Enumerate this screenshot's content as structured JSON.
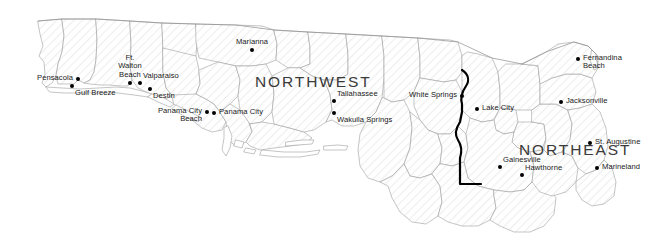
{
  "map": {
    "title": "North Florida Regions",
    "background_color": "#ffffff",
    "county_outline_color": "#9a9a9a",
    "region_boundary_color": "#000000",
    "marker_color": "#000000",
    "label_color": "#1a1a1a",
    "region_label_color": "#3a3a3a",
    "county_fill": "#fefefe",
    "hatch_color": "#f0f0f0"
  },
  "regions": [
    {
      "name": "NORTHWEST",
      "x": 255,
      "y": 73
    },
    {
      "name": "NORTHEAST",
      "x": 519,
      "y": 141
    }
  ],
  "cities": [
    {
      "name": "Pensacola",
      "x": 78,
      "y": 79,
      "anchor": "left",
      "lines": [
        "Pensacola"
      ]
    },
    {
      "name": "Gulf Breeze",
      "x": 72,
      "y": 86,
      "anchor": "below-right",
      "lines": [
        "Gulf Breeze"
      ]
    },
    {
      "name": "Ft. Walton Beach",
      "x": 130,
      "y": 83,
      "anchor": "above",
      "lines": [
        "Ft.",
        "Walton",
        "Beach"
      ]
    },
    {
      "name": "Valparaiso",
      "x": 140,
      "y": 83,
      "anchor": "above-right",
      "lines": [
        "Valparaiso"
      ]
    },
    {
      "name": "Destin",
      "x": 150,
      "y": 89,
      "anchor": "below-right",
      "lines": [
        "Destin"
      ]
    },
    {
      "name": "Panama City Beach",
      "x": 207,
      "y": 112,
      "anchor": "left",
      "lines": [
        "Panama City",
        "Beach"
      ]
    },
    {
      "name": "Panama City",
      "x": 214,
      "y": 113,
      "anchor": "right",
      "lines": [
        "Panama City"
      ]
    },
    {
      "name": "Marianna",
      "x": 252,
      "y": 50,
      "anchor": "above",
      "lines": [
        "Marianna"
      ]
    },
    {
      "name": "Tallahassee",
      "x": 334,
      "y": 101,
      "anchor": "above-right",
      "lines": [
        "Tallahassee"
      ]
    },
    {
      "name": "Wakulla Springs",
      "x": 334,
      "y": 113,
      "anchor": "below-right",
      "lines": [
        "Wakulla Springs"
      ]
    },
    {
      "name": "White Springs",
      "x": 462,
      "y": 96,
      "anchor": "left",
      "lines": [
        "White Springs"
      ]
    },
    {
      "name": "Lake City",
      "x": 477,
      "y": 109,
      "anchor": "right",
      "lines": [
        "Lake City"
      ]
    },
    {
      "name": "Fernandina Beach",
      "x": 578,
      "y": 59,
      "anchor": "right",
      "lines": [
        "Fernandina",
        "Beach"
      ]
    },
    {
      "name": "Jacksonville",
      "x": 561,
      "y": 102,
      "anchor": "right",
      "lines": [
        "Jacksonville"
      ]
    },
    {
      "name": "St. Augustine",
      "x": 590,
      "y": 143,
      "anchor": "right",
      "lines": [
        "St. Augustine"
      ]
    },
    {
      "name": "Gainesville",
      "x": 500,
      "y": 167,
      "anchor": "above-right",
      "lines": [
        "Gainesville"
      ]
    },
    {
      "name": "Hawthorne",
      "x": 522,
      "y": 175,
      "anchor": "above-right",
      "lines": [
        "Hawthorne"
      ]
    },
    {
      "name": "Marineland",
      "x": 597,
      "y": 168,
      "anchor": "right",
      "lines": [
        "Marineland"
      ]
    }
  ]
}
